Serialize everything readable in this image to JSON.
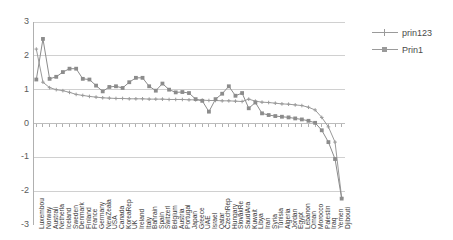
{
  "chart_data": {
    "type": "line",
    "title": "",
    "xlabel": "",
    "ylabel": "",
    "ylim": [
      -3,
      3
    ],
    "yticks": [
      3,
      2,
      1,
      0,
      -1,
      -2,
      -3
    ],
    "grid": true,
    "legend_position": "right",
    "categories": [
      "Luxembou",
      "Norway",
      "Australi",
      "Netherla",
      "Iceland",
      "Sweden",
      "Denmark",
      "Finland",
      "France",
      "Germany",
      "NewZeala",
      "USA",
      "Canada",
      "KoreaRep",
      "UK",
      "Ireland",
      "Italy",
      "Bahrain",
      "Spain",
      "Switzerl",
      "Belgium",
      "Austria",
      "Portugal",
      "Japan",
      "Greece",
      "UAE",
      "Israel",
      "Qatar",
      "CzechRep",
      "Hungary",
      "SlovakRe",
      "SaudiAra",
      "Kuwait",
      "Libya",
      "Iran",
      "Syria",
      "Tunisia",
      "Algeria",
      "Jordan",
      "Egypt",
      "Lebanon",
      "Oman",
      "Morocco",
      "Palestin",
      "Iraq",
      "Yemen",
      "Djibouti"
    ],
    "series": [
      {
        "name": "prin123",
        "marker": "plus",
        "color": "#9a9a9a",
        "values": [
          2.2,
          1.22,
          1.06,
          1.0,
          0.97,
          0.92,
          0.86,
          0.83,
          0.8,
          0.78,
          0.76,
          0.75,
          0.74,
          0.74,
          0.73,
          0.73,
          0.73,
          0.72,
          0.72,
          0.72,
          0.71,
          0.71,
          0.71,
          0.7,
          0.7,
          0.69,
          0.68,
          0.68,
          0.67,
          0.67,
          0.66,
          0.65,
          0.72,
          0.66,
          0.63,
          0.62,
          0.6,
          0.58,
          0.57,
          0.55,
          0.53,
          0.48,
          0.4,
          0.18,
          -0.1,
          -0.55,
          -2.2
        ]
      },
      {
        "name": "Prin1",
        "marker": "square",
        "color": "#8c8c8c",
        "values": [
          1.3,
          2.5,
          1.32,
          1.38,
          1.52,
          1.62,
          1.62,
          1.32,
          1.3,
          1.12,
          0.95,
          1.08,
          1.1,
          1.05,
          1.22,
          1.35,
          1.35,
          1.1,
          0.97,
          1.18,
          1.0,
          0.92,
          0.93,
          0.9,
          0.72,
          0.67,
          0.35,
          0.72,
          0.88,
          1.1,
          0.82,
          0.9,
          0.45,
          0.62,
          0.3,
          0.25,
          0.22,
          0.2,
          0.18,
          0.15,
          0.12,
          0.08,
          0.02,
          -0.2,
          -0.55,
          -1.05,
          -2.22
        ]
      }
    ]
  },
  "legend": {
    "items": [
      {
        "label": "prin123"
      },
      {
        "label": "Prin1"
      }
    ]
  }
}
